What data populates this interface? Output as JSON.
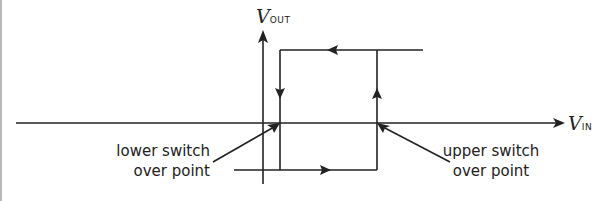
{
  "diagram": {
    "type": "hysteresis-loop",
    "colors": {
      "line": "#222222",
      "background": "#ffffff"
    },
    "axes": {
      "x": {
        "symbol": "V",
        "subscript": "IN"
      },
      "y": {
        "symbol": "V",
        "subscript": "OUT"
      }
    },
    "annotations": [
      {
        "id": "lower",
        "line1": "lower switch",
        "line2": "over point"
      },
      {
        "id": "upper",
        "line1": "upper switch",
        "line2": "over point"
      }
    ],
    "loop": {
      "top_direction": "left",
      "left_side_direction": "down",
      "right_side_direction": "up",
      "bottom_direction": "right"
    }
  }
}
